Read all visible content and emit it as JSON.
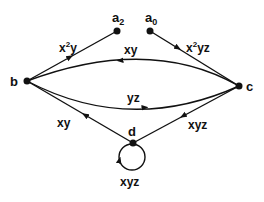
{
  "diagram": {
    "type": "directed-graph",
    "colors": {
      "ink": "#111111",
      "background": "#ffffff"
    },
    "nodes": [
      {
        "id": "b",
        "label": "b"
      },
      {
        "id": "c",
        "label": "c"
      },
      {
        "id": "d",
        "label": "d"
      },
      {
        "id": "a2",
        "label": "a",
        "sub": "2"
      },
      {
        "id": "a0",
        "label": "a",
        "sub": "0"
      }
    ],
    "edges": [
      {
        "from": "b",
        "to": "a2",
        "label_base": "x",
        "label_sup": "2",
        "label_rest": "y"
      },
      {
        "from": "a0",
        "to": "c",
        "label_base": "x",
        "label_sup": "2",
        "label_rest": "yz"
      },
      {
        "from": "c",
        "to": "b",
        "label": "xy"
      },
      {
        "from": "b",
        "to": "c",
        "label": "yz"
      },
      {
        "from": "c",
        "to": "d",
        "label": "xyz"
      },
      {
        "from": "d",
        "to": "b",
        "label": "xy"
      },
      {
        "from": "d",
        "to": "d",
        "label": "xyz"
      }
    ]
  }
}
